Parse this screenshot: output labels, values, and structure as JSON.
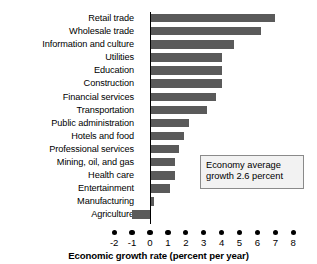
{
  "chart_data": {
    "type": "bar",
    "orientation": "horizontal",
    "title": "",
    "xlabel": "Economic growth rate (percent per year)",
    "ylabel": "",
    "xlim": [
      -2,
      8
    ],
    "xticks": [
      -2,
      -1,
      0,
      1,
      2,
      3,
      4,
      5,
      6,
      7,
      8
    ],
    "xtick_labels": [
      "-2",
      "-1",
      "0",
      "1",
      "2",
      "3",
      "4",
      "5",
      "6",
      "7",
      "8"
    ],
    "grid": false,
    "legend": null,
    "bar_color": "#5a5a5a",
    "categories": [
      "Retail trade",
      "Wholesale trade",
      "Information and culture",
      "Utilities",
      "Education",
      "Construction",
      "Financial services",
      "Transportation",
      "Public administration",
      "Hotels and food",
      "Professional services",
      "Mining, oil, and gas",
      "Health care",
      "Entertainment",
      "Manufacturing",
      "Agriculture"
    ],
    "values": [
      7.0,
      6.2,
      4.7,
      4.0,
      4.0,
      4.0,
      3.7,
      3.2,
      2.2,
      1.9,
      1.6,
      1.4,
      1.4,
      1.1,
      0.2,
      -1.0
    ],
    "annotations": [
      {
        "name": "economy-average-callout",
        "lines": [
          "Economy average",
          "growth 2.6 percent"
        ],
        "value": 2.6
      }
    ]
  },
  "callout": {
    "line1": "Economy average",
    "line2": "growth 2.6 percent"
  }
}
